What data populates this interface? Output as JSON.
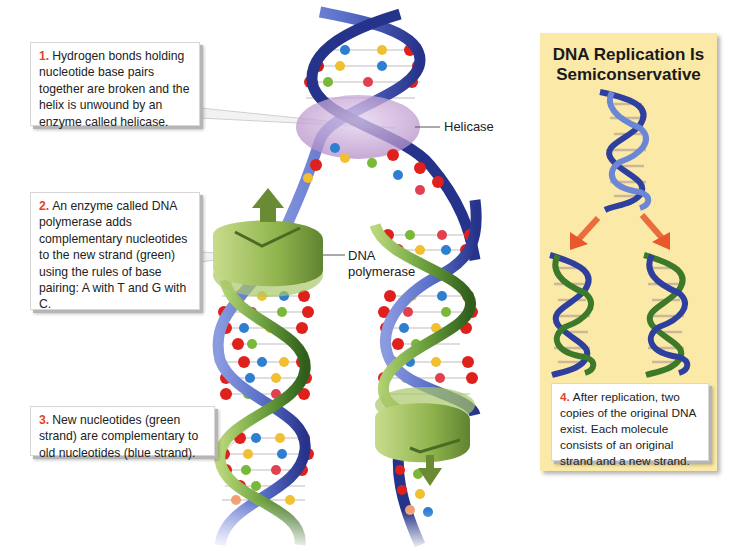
{
  "diagram": {
    "title": "DNA Replication",
    "callouts": [
      {
        "number": "1.",
        "text": "Hydrogen bonds holding nucleotide base pairs together are broken and the helix is unwound by an enzyme called helicase."
      },
      {
        "number": "2.",
        "text": "An enzyme called DNA polymerase adds complementary nucleotides to the new strand (green) using the rules of base pairing: A with T and G with C."
      },
      {
        "number": "3.",
        "text": "New nucleotides (green strand) are complementary to old nucleotides (blue strand)."
      },
      {
        "number": "4.",
        "text": "After replication, two copies of the original DNA exist. Each molecule consists of an original strand and a new strand."
      }
    ],
    "labels": {
      "helicase": "Helicase",
      "dna_polymerase_line1": "DNA",
      "dna_polymerase_line2": "polymerase"
    },
    "panel": {
      "title_line1": "DNA Replication Is",
      "title_line2": "Semiconservative"
    },
    "colors": {
      "old_strand": "#2f3f9e",
      "new_strand": "#3c7a2a",
      "helicase": "#c9a6d6",
      "polymerase": "#9cbf5a",
      "arrow": "#e8582c",
      "panel_bg": "#fbe9a8",
      "number_accent": "#e0452a"
    }
  }
}
